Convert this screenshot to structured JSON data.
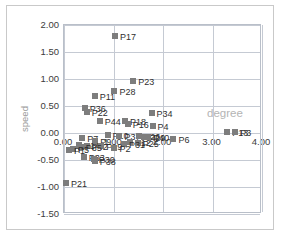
{
  "chart_data": {
    "type": "scatter",
    "title": "",
    "xlabel": "degree",
    "ylabel": "speed",
    "xlim": [
      0.0,
      4.0
    ],
    "ylim": [
      -1.5,
      2.0
    ],
    "xticks": [
      "0.00",
      "1.00",
      "2.00",
      "3.00",
      "4.00"
    ],
    "xtick_values": [
      0.0,
      1.0,
      2.0,
      3.0,
      4.0
    ],
    "yticks": [
      "2.00",
      "1.50",
      "1.00",
      "0.50",
      "0.00",
      "-0.50",
      "-1.00",
      "-1.50"
    ],
    "ytick_values": [
      2.0,
      1.5,
      1.0,
      0.5,
      0.0,
      -0.5,
      -1.0,
      -1.5
    ],
    "grid": true,
    "legend": false,
    "marker_color": "#7d7d7d",
    "series": [
      {
        "name": "points",
        "points": [
          {
            "label": "P17",
            "x": 1.03,
            "y": 1.8
          },
          {
            "label": "P23",
            "x": 1.4,
            "y": 0.97
          },
          {
            "label": "P28",
            "x": 1.02,
            "y": 0.77
          },
          {
            "label": "P11",
            "x": 0.62,
            "y": 0.68
          },
          {
            "label": "P36",
            "x": 0.42,
            "y": 0.47
          },
          {
            "label": "P22",
            "x": 0.46,
            "y": 0.38
          },
          {
            "label": "P34",
            "x": 1.77,
            "y": 0.37
          },
          {
            "label": "P18",
            "x": 1.23,
            "y": 0.22
          },
          {
            "label": "P44",
            "x": 0.72,
            "y": 0.22
          },
          {
            "label": "P16",
            "x": 1.29,
            "y": 0.16
          },
          {
            "label": "P4",
            "x": 1.79,
            "y": 0.13
          },
          {
            "label": "P13",
            "x": 3.3,
            "y": 0.02
          },
          {
            "label": "P3",
            "x": 3.46,
            "y": 0.02
          },
          {
            "label": "P10",
            "x": 0.88,
            "y": -0.04
          },
          {
            "label": "P37",
            "x": 1.12,
            "y": -0.05
          },
          {
            "label": "P26",
            "x": 1.52,
            "y": -0.06
          },
          {
            "label": "P29",
            "x": 1.62,
            "y": -0.07
          },
          {
            "label": "P40",
            "x": 1.7,
            "y": -0.08
          },
          {
            "label": "P6",
            "x": 2.21,
            "y": -0.12
          },
          {
            "label": "P7",
            "x": 0.37,
            "y": -0.1
          },
          {
            "label": "P9",
            "x": 0.63,
            "y": -0.15
          },
          {
            "label": "P12",
            "x": 1.33,
            "y": -0.16
          },
          {
            "label": "P25",
            "x": 1.49,
            "y": -0.19
          },
          {
            "label": "P31",
            "x": 1.21,
            "y": -0.2
          },
          {
            "label": "P14",
            "x": 0.3,
            "y": -0.22
          },
          {
            "label": "P42",
            "x": 0.46,
            "y": -0.24
          },
          {
            "label": "P19",
            "x": 0.75,
            "y": -0.24
          },
          {
            "label": "P35",
            "x": 0.34,
            "y": -0.26
          },
          {
            "label": "P2",
            "x": 1.02,
            "y": -0.28
          },
          {
            "label": "P5",
            "x": 0.18,
            "y": -0.3
          },
          {
            "label": "P1",
            "x": 0.1,
            "y": -0.31
          },
          {
            "label": "P33",
            "x": 0.4,
            "y": -0.45
          },
          {
            "label": "P30",
            "x": 0.6,
            "y": -0.48
          },
          {
            "label": "P38",
            "x": 0.62,
            "y": -0.52
          },
          {
            "label": "P21",
            "x": 0.04,
            "y": -0.93
          }
        ]
      }
    ]
  },
  "axis": {
    "ylabel": "speed",
    "xlabel": "degree"
  }
}
